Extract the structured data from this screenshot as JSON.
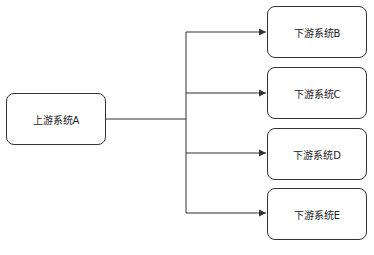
{
  "diagram": {
    "type": "flow",
    "source": {
      "id": "A",
      "label": "上游系统A"
    },
    "targets": [
      {
        "id": "B",
        "label": "下游系统B"
      },
      {
        "id": "C",
        "label": "下游系统C"
      },
      {
        "id": "D",
        "label": "下游系统D"
      },
      {
        "id": "E",
        "label": "下游系统E"
      }
    ],
    "edges": [
      {
        "from": "A",
        "to": "B"
      },
      {
        "from": "A",
        "to": "C"
      },
      {
        "from": "A",
        "to": "D"
      },
      {
        "from": "A",
        "to": "E"
      }
    ],
    "colors": {
      "stroke": "#333333",
      "background": "#ffffff",
      "text": "#222222"
    }
  }
}
